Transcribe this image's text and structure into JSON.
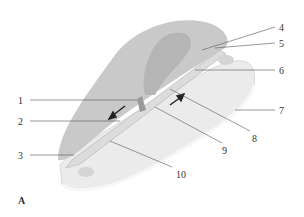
{
  "figure": {
    "panel_label": "A",
    "colors": {
      "background": "#ffffff",
      "upper_surface": "#c9c9c9",
      "inner_region": "#b5b5b5",
      "lower_surface": "#ebebeb",
      "rim": "#f4f4f4",
      "channel": "#dcdcdc",
      "leader_line": "#555555",
      "arrow": "#222222"
    },
    "callouts": [
      {
        "id": 1,
        "label": "1",
        "x": 18,
        "y": 98
      },
      {
        "id": 2,
        "label": "2",
        "x": 18,
        "y": 119
      },
      {
        "id": 3,
        "label": "3",
        "x": 18,
        "y": 153
      },
      {
        "id": 4,
        "label": "4",
        "x": 279,
        "y": 24
      },
      {
        "id": 5,
        "label": "5",
        "x": 279,
        "y": 40
      },
      {
        "id": 6,
        "label": "6",
        "x": 279,
        "y": 67
      },
      {
        "id": 7,
        "label": "7",
        "x": 279,
        "y": 108
      },
      {
        "id": 8,
        "label": "8",
        "x": 252,
        "y": 134
      },
      {
        "id": 9,
        "label": "9",
        "x": 222,
        "y": 146
      },
      {
        "id": 10,
        "label": "10",
        "x": 176,
        "y": 170
      }
    ]
  }
}
